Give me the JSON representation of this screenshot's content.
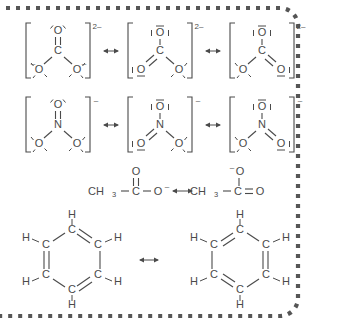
{
  "figure": {
    "background_color": "#ffffff",
    "ink_color": "#4a4a4a",
    "border": {
      "style": "dotted",
      "color": "#555555",
      "sides": "top-right-bottom",
      "corner_radius": 18
    },
    "resonance_arrow_symbol": "↔"
  },
  "rows": [
    {
      "name": "carbonate",
      "ion_label": "CO3 2-",
      "charge_label": "2–",
      "center_atom": "C",
      "structures": [
        {
          "index": 1,
          "top_oxygen": {
            "label": "O",
            "bond": "double",
            "charge": "",
            "lone_pairs": "arcs"
          },
          "left_oxygen": {
            "label": "O",
            "bond": "single",
            "charge": "–",
            "lone_pairs": "arcs"
          },
          "right_oxygen": {
            "label": "O",
            "bond": "single",
            "charge": "–",
            "lone_pairs": "arcs"
          }
        },
        {
          "index": 2,
          "top_oxygen": {
            "label": "O",
            "bond": "single",
            "charge": "–",
            "lone_pairs": "bars"
          },
          "left_oxygen": {
            "label": "O",
            "bond": "double",
            "charge": "–",
            "lone_pairs": "bars"
          },
          "right_oxygen": {
            "label": "O",
            "bond": "single",
            "charge": "–",
            "lone_pairs": "arcs"
          }
        },
        {
          "index": 3,
          "top_oxygen": {
            "label": "O",
            "bond": "single",
            "charge": "–",
            "lone_pairs": "bars"
          },
          "left_oxygen": {
            "label": "O",
            "bond": "single",
            "charge": "–",
            "lone_pairs": "arcs"
          },
          "right_oxygen": {
            "label": "O",
            "bond": "double",
            "charge": "–",
            "lone_pairs": "bars"
          }
        }
      ]
    },
    {
      "name": "nitrate",
      "ion_label": "NO3 -",
      "charge_label": "–",
      "center_atom": "N",
      "structures": [
        {
          "index": 1,
          "top_oxygen": {
            "label": "O",
            "bond": "double",
            "charge": "",
            "lone_pairs": "arcs"
          },
          "left_oxygen": {
            "label": "O",
            "bond": "single",
            "charge": "–",
            "lone_pairs": "arcs"
          },
          "right_oxygen": {
            "label": "O",
            "bond": "single",
            "charge": "–",
            "lone_pairs": "arcs"
          }
        },
        {
          "index": 2,
          "top_oxygen": {
            "label": "O",
            "bond": "single",
            "charge": "–",
            "lone_pairs": "bars"
          },
          "left_oxygen": {
            "label": "O",
            "bond": "double",
            "charge": "–",
            "lone_pairs": "bars"
          },
          "right_oxygen": {
            "label": "O",
            "bond": "single",
            "charge": "–",
            "lone_pairs": "arcs"
          }
        },
        {
          "index": 3,
          "top_oxygen": {
            "label": "O",
            "bond": "single",
            "charge": "–",
            "lone_pairs": "bars"
          },
          "left_oxygen": {
            "label": "O",
            "bond": "single",
            "charge": "–",
            "lone_pairs": "arcs"
          },
          "right_oxygen": {
            "label": "O",
            "bond": "double",
            "charge": "–",
            "lone_pairs": "bars"
          }
        }
      ]
    },
    {
      "name": "acetate",
      "structures": [
        {
          "index": 1,
          "methyl": "CH",
          "methyl_subscript": "3",
          "carbon": "C",
          "top_oxygen": "O",
          "top_bond": "double",
          "terminal_oxygen": "O",
          "terminal_bond": "single",
          "terminal_charge": "–"
        },
        {
          "index": 2,
          "methyl": "CH",
          "methyl_subscript": "3",
          "carbon": "C",
          "top_oxygen": "O",
          "top_bond": "single",
          "top_charge": "–",
          "terminal_oxygen": "O",
          "terminal_bond": "double"
        }
      ]
    },
    {
      "name": "benzene",
      "structures": [
        {
          "index": 1,
          "carbon_label": "C",
          "hydrogen_label": "H",
          "double_bond_positions": [
            "top-right",
            "left",
            "bottom-right"
          ]
        },
        {
          "index": 2,
          "carbon_label": "C",
          "hydrogen_label": "H",
          "double_bond_positions": [
            "top-left",
            "right",
            "bottom-left"
          ]
        }
      ]
    }
  ]
}
